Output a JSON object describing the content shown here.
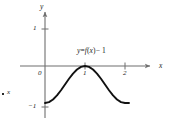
{
  "figure": {
    "type": "math-graph",
    "background_color": "#ffffff",
    "axis_color": "#6f6f6f",
    "curve_color": "#111111",
    "text_color": "#1a1a1a"
  },
  "axes": {
    "x_axis_label": "x",
    "y_axis_label": "y",
    "origin_label": "0",
    "x_ticks": [
      {
        "value": 1,
        "label": "1"
      },
      {
        "value": 2,
        "label": "2"
      }
    ],
    "y_ticks": [
      {
        "value": 1,
        "label": "1"
      },
      {
        "value": -1,
        "label": "−1"
      }
    ],
    "xlim": [
      -0.3,
      2.4
    ],
    "ylim": [
      -1.25,
      1.45
    ],
    "grid": false
  },
  "annotations": {
    "curve_equation": "y = f(x) − 1",
    "curve_equation_parts": {
      "y": "y",
      "equals": "=",
      "f": "f",
      "open_paren": "(",
      "x": "x",
      "close_paren": ")",
      "minus_one": "− 1"
    },
    "stray_x_label": "x"
  },
  "chart_data": {
    "type": "line",
    "title": "",
    "xlabel": "x",
    "ylabel": "y",
    "xlim": [
      -0.3,
      2.4
    ],
    "ylim": [
      -1.25,
      1.45
    ],
    "grid": false,
    "legend": "none",
    "series": [
      {
        "name": "y = f(x) − 1",
        "description": "Cosine-shaped curve: minimum −1 at x=0, maximum 0 at x=1, minimum −1 at x=2",
        "x": [
          0.0,
          0.1,
          0.2,
          0.3,
          0.4,
          0.5,
          0.6,
          0.7,
          0.8,
          0.9,
          1.0,
          1.1,
          1.2,
          1.3,
          1.4,
          1.5,
          1.6,
          1.7,
          1.8,
          1.9,
          2.0,
          2.1
        ],
        "y": [
          -1.0,
          -0.976,
          -0.905,
          -0.794,
          -0.655,
          -0.5,
          -0.345,
          -0.206,
          -0.095,
          -0.024,
          0.0,
          -0.024,
          -0.095,
          -0.206,
          -0.345,
          -0.5,
          -0.655,
          -0.794,
          -0.905,
          -0.976,
          -1.0,
          -1.0
        ]
      }
    ],
    "key_points": [
      {
        "x": 0,
        "y": -1,
        "label": "minimum"
      },
      {
        "x": 1,
        "y": 0,
        "label": "maximum / touches x-axis"
      },
      {
        "x": 2,
        "y": -1,
        "label": "minimum"
      }
    ]
  }
}
